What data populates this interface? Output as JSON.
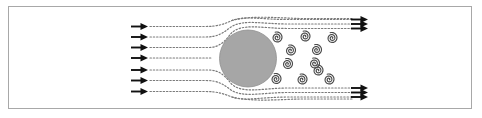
{
  "figure": {
    "frame": {
      "x": 8,
      "y": 6,
      "width": 464,
      "height": 103,
      "border_color": "#a8a8a8",
      "background_color": "#ffffff"
    },
    "canvas": {
      "width": 482,
      "height": 118
    }
  },
  "colors": {
    "cylinder_fill": "#a6a6a6",
    "cylinder_stroke": "#8f8f8f",
    "streamline": "#7a7a7a",
    "arrow": "#111111",
    "vortex_stroke": "#4a4a4a",
    "frame_border": "#a8a8a8",
    "background": "#ffffff"
  },
  "cylinder": {
    "name": "circular-cylinder",
    "cx": 248,
    "cy": 58.5,
    "r": 28.5,
    "fill": "#a6a6a6"
  },
  "inlet_arrows": {
    "count": 7,
    "arrow_tip_x": 148,
    "arrow_tail_x": 131,
    "items": [
      {
        "y": 26.5
      },
      {
        "y": 37.0
      },
      {
        "y": 47.5
      },
      {
        "y": 58.0
      },
      {
        "y": 70.0
      },
      {
        "y": 80.5
      },
      {
        "y": 91.5
      }
    ]
  },
  "outlet_arrows": {
    "top_group": {
      "arrow_tip_x": 368,
      "arrow_tail_x": 351,
      "items": [
        {
          "y": 19.5
        },
        {
          "y": 24.0
        },
        {
          "y": 28.5
        }
      ]
    },
    "bottom_group": {
      "arrow_tip_x": 368,
      "arrow_tail_x": 351,
      "items": [
        {
          "y": 88.0
        },
        {
          "y": 92.5
        },
        {
          "y": 97.0
        }
      ]
    }
  },
  "streamlines": {
    "style": "dotted",
    "dash_pattern": "1.4 1.9",
    "stroke_width": 1.2,
    "inlet_paths": [
      "M150,26.5 L205,26.5 C218,26.5 224,24 232,20.5 C244,15.5 262,19.5 288,19.5 L352,19.5",
      "M150,37 L206,37 C219,37 224,32 231,27 C243,19 262,24 288,24 L352,24",
      "M150,47.5 L209,47.5 C220,47.5 226,40 231,33.5 C242,22.5 262,28.5 288,28.5 L352,28.5",
      "M150,58 L212,58",
      "M150,70 L209,70 C220,70 226,77 231,83.5 C242,94.5 262,88 288,88 L352,88",
      "M150,80.5 L206,80.5 C219,80.5 224,85 231,90 C243,98 262,92.5 288,92.5 L352,92.5",
      "M150,91.5 L205,91.5 C218,91.5 224,94 232,97 C244,101.5 262,97 288,97 L352,97"
    ],
    "wake_boundary_paths": [
      "M232,20.5 C252,15 278,18 300,18.5 L352,18.6",
      "M232,97 C252,102 278,99.5 300,99 L352,99"
    ]
  },
  "vortices": {
    "name": "vortex-street",
    "description": "Staggered von Karman vortex street downstream of cylinder",
    "radius": 5.6,
    "turns": 2.4,
    "items": [
      {
        "cx": 277.0,
        "cy": 37.5,
        "sense": "ccw"
      },
      {
        "cx": 305.0,
        "cy": 36.5,
        "sense": "ccw"
      },
      {
        "cx": 332.0,
        "cy": 38.0,
        "sense": "ccw"
      },
      {
        "cx": 290.5,
        "cy": 50.5,
        "sense": "ccw"
      },
      {
        "cx": 316.5,
        "cy": 50.0,
        "sense": "ccw"
      },
      {
        "cx": 287.5,
        "cy": 64.0,
        "sense": "ccw"
      },
      {
        "cx": 314.5,
        "cy": 63.5,
        "sense": "ccw"
      },
      {
        "cx": 276.0,
        "cy": 79.0,
        "sense": "ccw"
      },
      {
        "cx": 302.0,
        "cy": 79.5,
        "sense": "ccw"
      },
      {
        "cx": 329.0,
        "cy": 79.5,
        "sense": "ccw"
      },
      {
        "cx": 318.0,
        "cy": 70.5,
        "sense": "ccw"
      }
    ]
  }
}
